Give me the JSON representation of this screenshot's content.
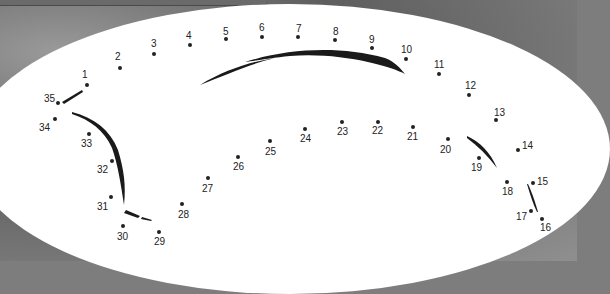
{
  "puzzle": {
    "type": "connect-the-dots",
    "dots": [
      {
        "n": "1",
        "x": 87,
        "y": 85,
        "lx": 82,
        "ly": 70
      },
      {
        "n": "2",
        "x": 120,
        "y": 68,
        "lx": 115,
        "ly": 52
      },
      {
        "n": "3",
        "x": 154,
        "y": 54,
        "lx": 151,
        "ly": 39
      },
      {
        "n": "4",
        "x": 190,
        "y": 45,
        "lx": 186,
        "ly": 31
      },
      {
        "n": "5",
        "x": 226,
        "y": 39,
        "lx": 223,
        "ly": 27
      },
      {
        "n": "6",
        "x": 262,
        "y": 37,
        "lx": 259,
        "ly": 23
      },
      {
        "n": "7",
        "x": 298,
        "y": 37,
        "lx": 296,
        "ly": 24
      },
      {
        "n": "8",
        "x": 335,
        "y": 40,
        "lx": 333,
        "ly": 27
      },
      {
        "n": "9",
        "x": 372,
        "y": 48,
        "lx": 369,
        "ly": 35
      },
      {
        "n": "10",
        "x": 406,
        "y": 59,
        "lx": 401,
        "ly": 45
      },
      {
        "n": "11",
        "x": 439,
        "y": 74,
        "lx": 434,
        "ly": 60
      },
      {
        "n": "12",
        "x": 469,
        "y": 95,
        "lx": 465,
        "ly": 81
      },
      {
        "n": "13",
        "x": 496,
        "y": 120,
        "lx": 494,
        "ly": 108
      },
      {
        "n": "14",
        "x": 518,
        "y": 150,
        "lx": 522,
        "ly": 141
      },
      {
        "n": "15",
        "x": 533,
        "y": 183,
        "lx": 537,
        "ly": 177
      },
      {
        "n": "16",
        "x": 542,
        "y": 219,
        "lx": 540,
        "ly": 223
      },
      {
        "n": "17",
        "x": 531,
        "y": 211,
        "lx": 516,
        "ly": 212
      },
      {
        "n": "18",
        "x": 507,
        "y": 182,
        "lx": 502,
        "ly": 187
      },
      {
        "n": "19",
        "x": 479,
        "y": 158,
        "lx": 471,
        "ly": 163
      },
      {
        "n": "20",
        "x": 448,
        "y": 139,
        "lx": 440,
        "ly": 145
      },
      {
        "n": "21",
        "x": 413,
        "y": 127,
        "lx": 407,
        "ly": 132
      },
      {
        "n": "22",
        "x": 378,
        "y": 122,
        "lx": 372,
        "ly": 126
      },
      {
        "n": "23",
        "x": 342,
        "y": 122,
        "lx": 337,
        "ly": 127
      },
      {
        "n": "24",
        "x": 305,
        "y": 129,
        "lx": 300,
        "ly": 134
      },
      {
        "n": "25",
        "x": 270,
        "y": 141,
        "lx": 265,
        "ly": 147
      },
      {
        "n": "26",
        "x": 238,
        "y": 157,
        "lx": 233,
        "ly": 162
      },
      {
        "n": "27",
        "x": 208,
        "y": 178,
        "lx": 202,
        "ly": 184
      },
      {
        "n": "28",
        "x": 182,
        "y": 204,
        "lx": 178,
        "ly": 210
      },
      {
        "n": "29",
        "x": 159,
        "y": 232,
        "lx": 154,
        "ly": 237
      },
      {
        "n": "30",
        "x": 123,
        "y": 226,
        "lx": 117,
        "ly": 232
      },
      {
        "n": "31",
        "x": 111,
        "y": 197,
        "lx": 97,
        "ly": 202
      },
      {
        "n": "32",
        "x": 112,
        "y": 161,
        "lx": 97,
        "ly": 165
      },
      {
        "n": "33",
        "x": 89,
        "y": 134,
        "lx": 81,
        "ly": 139
      },
      {
        "n": "34",
        "x": 55,
        "y": 119,
        "lx": 39,
        "ly": 123
      },
      {
        "n": "35",
        "x": 58,
        "y": 103,
        "lx": 44,
        "ly": 94
      }
    ]
  }
}
